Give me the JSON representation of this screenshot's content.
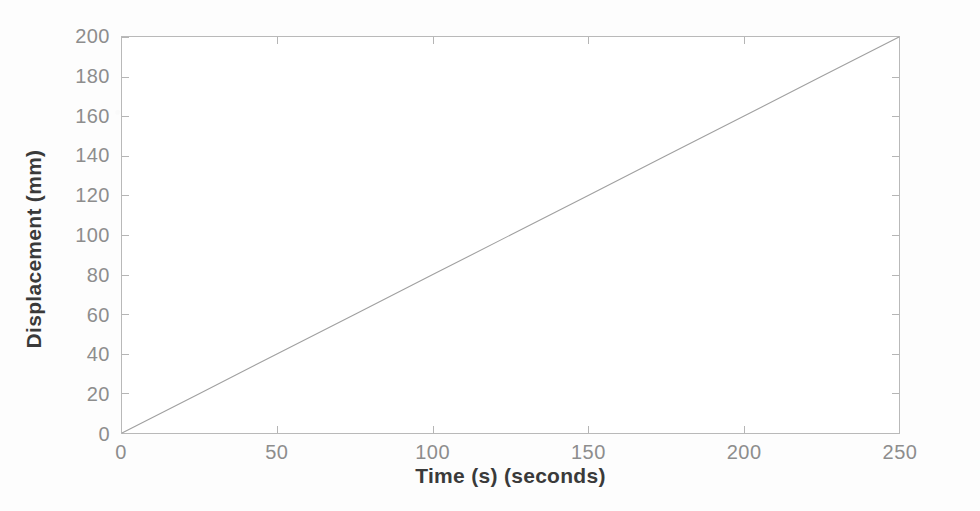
{
  "chart_data": {
    "type": "line",
    "title": "",
    "xlabel": "Time (s) (seconds)",
    "ylabel": "Displacement (mm)",
    "xlim": [
      0,
      250
    ],
    "ylim": [
      0,
      200
    ],
    "xticks": [
      0,
      50,
      100,
      150,
      200,
      250
    ],
    "yticks": [
      0,
      20,
      40,
      60,
      80,
      100,
      120,
      140,
      160,
      180,
      200
    ],
    "xtick_labels": [
      "0",
      "50",
      "100",
      "150",
      "200",
      "250"
    ],
    "ytick_labels": [
      "0",
      "20",
      "40",
      "60",
      "80",
      "100",
      "120",
      "140",
      "160",
      "180",
      "200"
    ],
    "grid": false,
    "legend": null,
    "series": [
      {
        "name": "Displacement",
        "color": "#a0a0a0",
        "style": "solid",
        "width": 1,
        "x": [
          0,
          25,
          50,
          75,
          100,
          125,
          150,
          175,
          200,
          225,
          250
        ],
        "values": [
          0,
          20,
          40,
          60,
          80,
          100,
          120,
          140,
          160,
          180,
          200
        ]
      }
    ],
    "annotations": []
  },
  "axes": {
    "x_title": "Time (s) (seconds)",
    "y_title": "Displacement (mm)",
    "axis_color": "#b9b9b9",
    "tick_label_color": "#8d8d8d",
    "title_color": "#3a3a3a"
  },
  "figure": {
    "background": "#fdfdfd",
    "plot_background": "#ffffff"
  }
}
